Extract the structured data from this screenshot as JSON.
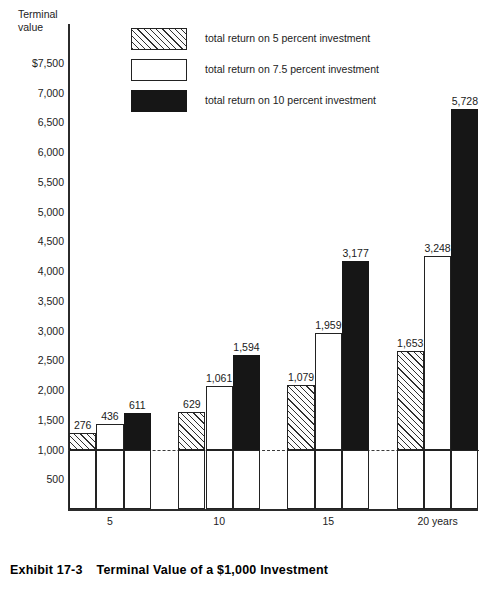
{
  "axis_title": "Terminal\nvalue",
  "caption": {
    "exhibit": "Exhibit 17-3",
    "title": "Terminal Value of a $1,000 Investment"
  },
  "legend": {
    "items": [
      {
        "swatch": "hatch",
        "label": "total return on 5 percent investment"
      },
      {
        "swatch": "white",
        "label": "total return on 7.5 percent investment"
      },
      {
        "swatch": "black",
        "label": "total return on 10 percent investment"
      }
    ]
  },
  "chart_data": {
    "type": "bar",
    "title": "Terminal Value of a $1,000 Investment",
    "xlabel": "years",
    "ylabel": "Terminal value",
    "ylim": [
      0,
      7500
    ],
    "ytick_labels": [
      "$7,500",
      "7,000",
      "6,500",
      "6,000",
      "5,500",
      "5,000",
      "4,500",
      "4,000",
      "3,500",
      "3,000",
      "2,500",
      "2,000",
      "1,500",
      "1,000",
      "500"
    ],
    "ytick_values": [
      7500,
      7000,
      6500,
      6000,
      5500,
      5000,
      4500,
      4000,
      3500,
      3000,
      2500,
      2000,
      1500,
      1000,
      500
    ],
    "categories": [
      "5",
      "10",
      "15",
      "20 years"
    ],
    "category_values": [
      5,
      10,
      15,
      20
    ],
    "grid": false,
    "legend_position": "top-center",
    "principal": 1000,
    "reference_line": {
      "value": 1000,
      "style": "dashed"
    },
    "note": "Each bar is a $1,000 principal base plus the labeled total return stacked above the 1,000 reference line; the printed label is the return amount and the bar top equals 1,000 + return.",
    "series": [
      {
        "name": "total return on 5 percent investment",
        "swatch": "hatch",
        "values": [
          276,
          629,
          1079,
          1653
        ],
        "terminal_values": [
          1276,
          1629,
          2079,
          2653
        ]
      },
      {
        "name": "total return on 7.5 percent investment",
        "swatch": "white",
        "values": [
          436,
          1061,
          1959,
          3248
        ],
        "terminal_values": [
          1436,
          2061,
          2959,
          4248
        ]
      },
      {
        "name": "total return on 10 percent investment",
        "swatch": "black",
        "values": [
          611,
          1594,
          3177,
          5728
        ],
        "terminal_values": [
          1611,
          2594,
          4177,
          6728
        ]
      }
    ],
    "bar_labels": [
      "276",
      "436",
      "611",
      "629",
      "1,061",
      "1,594",
      "1,079",
      "1,959",
      "3,177",
      "1,653",
      "3,248",
      "5,728"
    ]
  }
}
